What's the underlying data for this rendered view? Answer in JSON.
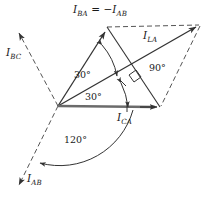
{
  "figure": {
    "width": 217,
    "height": 201,
    "background": "#ffffff",
    "stroke_color": "#333333",
    "text_color": "#1a1a1a"
  },
  "labels": {
    "i_ba_equals": {
      "lead": "I",
      "sub1": "BA",
      "operator": " = −",
      "lead2": "I",
      "sub2": "AB"
    },
    "i_bc": {
      "lead": "I",
      "sub": "BC"
    },
    "i_la": {
      "lead": "I",
      "sub": "LA"
    },
    "i_ca": {
      "lead": "I",
      "sub": "CA"
    },
    "i_ab": {
      "lead": "I",
      "sub": "AB"
    }
  },
  "angles": {
    "upper_30": "30°",
    "lower_30": "30°",
    "right_90": "90°",
    "bottom_120": "120°"
  },
  "geometry": {
    "origin": [
      58,
      106
    ],
    "vectors": [
      {
        "name": "I_BA",
        "to": [
          107,
          27
        ],
        "style": "solid",
        "arrow": true
      },
      {
        "name": "I_LA",
        "to": [
          200,
          25
        ],
        "style": "solid",
        "arrow": true
      },
      {
        "name": "I_CA",
        "to": [
          160,
          107
        ],
        "style": "solid",
        "arrow": true
      },
      {
        "name": "I_BC",
        "to": [
          16,
          28
        ],
        "style": "dashed",
        "arrow": true
      },
      {
        "name": "I_AB",
        "to": [
          15,
          192
        ],
        "style": "dashed",
        "arrow": true
      }
    ],
    "construction": [
      {
        "from": [
          107,
          27
        ],
        "to": [
          200,
          25
        ],
        "style": "dashed"
      },
      {
        "from": [
          160,
          107
        ],
        "to": [
          200,
          25
        ],
        "style": "dashed"
      },
      {
        "from": [
          107,
          27
        ],
        "to": [
          160,
          107
        ],
        "style": "solid"
      }
    ]
  }
}
